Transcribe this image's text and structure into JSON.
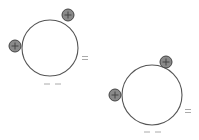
{
  "diagram": {
    "colors": {
      "sphere_stroke": "#555555",
      "charge_fill": "#8a8a8a",
      "charge_stroke": "#444444",
      "sign_color": "#aaaaaa"
    },
    "spheres": [
      {
        "id": "sphere-1",
        "cx": 50,
        "cy": 48,
        "r": 28,
        "positive_charges": [
          {
            "cx": 68,
            "cy": 15,
            "r": 6,
            "label": "+"
          },
          {
            "cx": 15,
            "cy": 46,
            "r": 6,
            "label": "+"
          }
        ],
        "negative_marks": [
          {
            "x": 84,
            "y": 58,
            "label": "="
          },
          {
            "x": 52,
            "y": 84,
            "label": "– –"
          }
        ]
      },
      {
        "id": "sphere-2",
        "cx": 152,
        "cy": 95,
        "r": 30,
        "positive_charges": [
          {
            "cx": 166,
            "cy": 62,
            "r": 6,
            "label": "+"
          },
          {
            "cx": 115,
            "cy": 95,
            "r": 6,
            "label": "+"
          }
        ],
        "negative_marks": [
          {
            "x": 188,
            "y": 111,
            "label": "="
          },
          {
            "x": 152,
            "y": 132,
            "label": "– –"
          }
        ]
      }
    ]
  }
}
